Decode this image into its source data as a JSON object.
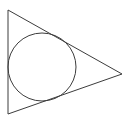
{
  "figure": {
    "kind": "geometry-diagram",
    "canvas": {
      "width": 130,
      "height": 123,
      "background_color": "#ffffff"
    },
    "style": {
      "stroke_color": "#3c3c3c",
      "stroke_width": 1,
      "fill": "none"
    },
    "triangle": {
      "name": "outer-triangle",
      "orientation": "right-pointing",
      "vertices": [
        {
          "label": "top-left",
          "x": 8,
          "y": 10
        },
        {
          "label": "right-apex",
          "x": 122,
          "y": 74
        },
        {
          "label": "bottom-left",
          "x": 8,
          "y": 114
        }
      ],
      "points_attr": "8,10 122,74 8,114",
      "sides": [
        {
          "label": "left-side",
          "from": "top-left",
          "to": "bottom-left"
        },
        {
          "label": "upper-right-side",
          "from": "top-left",
          "to": "right-apex"
        },
        {
          "label": "lower-right-side",
          "from": "bottom-left",
          "to": "right-apex"
        }
      ]
    },
    "circle": {
      "name": "inscribed-circle",
      "center_x": 42,
      "center_y": 67,
      "radius": 34,
      "bounds": {
        "left": 8,
        "right": 76,
        "top": 33,
        "bottom": 101
      },
      "tangent_to": [
        "left-side",
        "upper-right-side",
        "lower-right-side"
      ]
    },
    "labels": [],
    "annotations": []
  }
}
